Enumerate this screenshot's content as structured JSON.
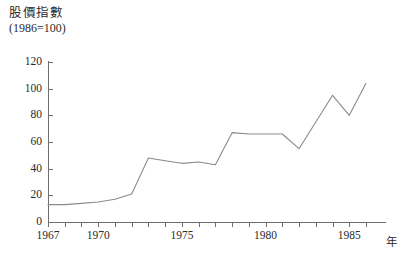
{
  "chart_data": {
    "type": "line",
    "title": "股價指數",
    "subtitle": "(1986=100)",
    "xlabel": "年",
    "ylabel": "",
    "ylim": [
      0,
      120
    ],
    "xlim": [
      1967,
      1986
    ],
    "grid": false,
    "legend": "none",
    "y_ticks": [
      0,
      20,
      40,
      60,
      80,
      100,
      120
    ],
    "x_ticks": [
      1967,
      1968,
      1969,
      1970,
      1971,
      1972,
      1973,
      1974,
      1975,
      1976,
      1977,
      1978,
      1979,
      1980,
      1981,
      1982,
      1983,
      1984,
      1985,
      1986
    ],
    "x_tick_labels": [
      {
        "year": 1967,
        "label": "1967"
      },
      {
        "year": 1970,
        "label": "1970"
      },
      {
        "year": 1975,
        "label": "1975"
      },
      {
        "year": 1980,
        "label": "1980"
      },
      {
        "year": 1985,
        "label": "1985"
      }
    ],
    "line_color": "#8a8a8a",
    "axis_color": "#6f6f6f",
    "series": [
      {
        "name": "股價指數",
        "x": [
          1967,
          1968,
          1969,
          1970,
          1971,
          1972,
          1973,
          1974,
          1975,
          1976,
          1977,
          1978,
          1979,
          1980,
          1981,
          1982,
          1983,
          1984,
          1985,
          1986
        ],
        "values": [
          13,
          13,
          14,
          15,
          17,
          21,
          48,
          46,
          44,
          45,
          43,
          67,
          66,
          66,
          66,
          55,
          75,
          95,
          80,
          104
        ]
      }
    ]
  },
  "axis_labels": {
    "y": [
      "0",
      "20",
      "40",
      "60",
      "80",
      "100",
      "120"
    ],
    "x_year_suffix": "年"
  }
}
